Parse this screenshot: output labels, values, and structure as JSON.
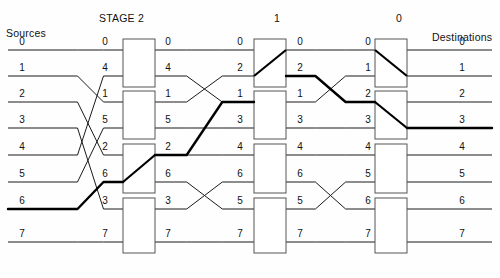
{
  "figure": {
    "kind": "multistage-interconnection-network",
    "title_left": "Sources",
    "title_right": "Destinations",
    "stage_headers": [
      {
        "label": "STAGE 2",
        "x": 140
      },
      {
        "label": "1",
        "x": 278
      },
      {
        "label": "0",
        "x": 400
      }
    ]
  },
  "colors": {
    "line": "#1a1a1a",
    "bold_path": "#000000",
    "box_stroke": "#555555",
    "box_fill": "#ffffff",
    "text": "#111111",
    "background": "#fefefe"
  },
  "geometry": {
    "row_y": [
      50,
      76,
      102,
      128,
      155,
      182,
      209,
      242
    ],
    "label_columns_x": [
      22,
      105,
      168,
      240,
      300,
      368,
      462
    ],
    "stage_box_x": [
      123,
      254,
      375
    ],
    "box_width": 32,
    "link_thin": 1.0,
    "link_bold": 2.4
  },
  "labels": {
    "sources": [
      "0",
      "1",
      "2",
      "3",
      "4",
      "5",
      "6",
      "7"
    ],
    "stage2_in": [
      "0",
      "4",
      "1",
      "5",
      "2",
      "6",
      "3",
      "7"
    ],
    "stage2_out": [
      "0",
      "4",
      "1",
      "5",
      "2",
      "6",
      "3",
      "7"
    ],
    "stage1_in": [
      "0",
      "2",
      "1",
      "3",
      "4",
      "6",
      "5",
      "7"
    ],
    "stage1_out": [
      "0",
      "2",
      "1",
      "3",
      "4",
      "6",
      "5",
      "7"
    ],
    "stage0_in": [
      "0",
      "1",
      "2",
      "3",
      "4",
      "5",
      "6",
      "7"
    ],
    "destinations": [
      "0",
      "1",
      "2",
      "3",
      "4",
      "5",
      "6",
      "7"
    ]
  },
  "chart_data": {
    "type": "diagram",
    "stages": [
      {
        "name": "STAGE 2",
        "boxes": [
          {
            "rows": [
              0,
              1
            ],
            "setting": "straight"
          },
          {
            "rows": [
              2,
              3
            ],
            "setting": "straight"
          },
          {
            "rows": [
              4,
              5
            ],
            "setting": "cross",
            "diagonal": "bottom-left-to-top-right"
          },
          {
            "rows": [
              6,
              7
            ],
            "setting": "straight"
          }
        ]
      },
      {
        "name": "1",
        "boxes": [
          {
            "rows": [
              0,
              1
            ],
            "setting": "cross",
            "diagonal": "bottom-left-to-top-right"
          },
          {
            "rows": [
              2,
              3
            ],
            "setting": "straight"
          },
          {
            "rows": [
              4,
              5
            ],
            "setting": "straight"
          },
          {
            "rows": [
              6,
              7
            ],
            "setting": "straight"
          }
        ]
      },
      {
        "name": "0",
        "boxes": [
          {
            "rows": [
              0,
              1
            ],
            "setting": "cross",
            "diagonal": "top-left-to-bottom-right"
          },
          {
            "rows": [
              2,
              3
            ],
            "setting": "cross",
            "diagonal": "top-left-to-bottom-right"
          },
          {
            "rows": [
              4,
              5
            ],
            "setting": "straight"
          },
          {
            "rows": [
              6,
              7
            ],
            "setting": "straight"
          }
        ]
      }
    ],
    "bold_route": {
      "source": 6,
      "destination": 3,
      "row_sequence": [
        6,
        5,
        5,
        4,
        2,
        2,
        1,
        1,
        2,
        2,
        3,
        3
      ]
    }
  }
}
